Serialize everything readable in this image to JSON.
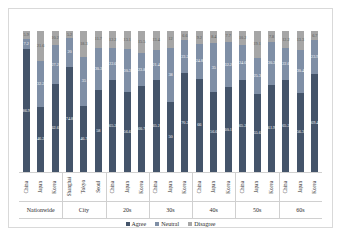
{
  "chart_data": {
    "type": "bar",
    "subtype": "100% stacked column",
    "title": "",
    "xlabel": "",
    "ylabel": "",
    "ylim": [
      0,
      100
    ],
    "grid": false,
    "legend_position": "bottom",
    "series": [
      {
        "name": "Agree",
        "color": "#44546a",
        "values": [
          86.9,
          46.2,
          62.6,
          74.8,
          46.7,
          58.0,
          65.2,
          56.6,
          60.7,
          65.2,
          50.0,
          70.2,
          66.0,
          56.6,
          60.1,
          65.2,
          55.6,
          61.9,
          65.2,
          56.3,
          69.4
        ]
      },
      {
        "name": "Neutral",
        "color": "#7f8fa6",
        "values": [
          7.2,
          32.2,
          27.2,
          20.0,
          35.0,
          30.3,
          22.6,
          30.3,
          23.8,
          21.4,
          38.0,
          23.2,
          24.8,
          35.0,
          32.2,
          24.6,
          25.3,
          30.3,
          22.6,
          30.4,
          23.9
        ]
      },
      {
        "name": "Disagree",
        "color": "#a6a6a6",
        "values": [
          5.9,
          21.6,
          10.2,
          5.2,
          18.3,
          11.7,
          12.2,
          13.1,
          15.5,
          13.4,
          12.0,
          6.6,
          9.2,
          8.4,
          7.7,
          10.2,
          19.1,
          7.8,
          12.2,
          13.3,
          6.7
        ]
      }
    ],
    "categories": [
      "China",
      "Japan",
      "Korea",
      "Shanghai",
      "Tokyo",
      "Seoul",
      "China",
      "Japan",
      "Korea",
      "China",
      "Japan",
      "Korea",
      "China",
      "Japan",
      "Korea",
      "China",
      "Japan",
      "Korea",
      "China",
      "Japan",
      "Korea"
    ],
    "groups": [
      {
        "label": "Nationwide",
        "count": 3
      },
      {
        "label": "City",
        "count": 3
      },
      {
        "label": "20s",
        "count": 3
      },
      {
        "label": "30s",
        "count": 3
      },
      {
        "label": "40s",
        "count": 3
      },
      {
        "label": "50s",
        "count": 3
      },
      {
        "label": "60s",
        "count": 3
      }
    ]
  },
  "legend": {
    "items": [
      {
        "label": "Agree",
        "color": "#44546a"
      },
      {
        "label": "Neutral",
        "color": "#7f8fa6"
      },
      {
        "label": "Disagree",
        "color": "#a6a6a6"
      }
    ]
  },
  "colors": {
    "agree": "#44546a",
    "neutral": "#7f8fa6",
    "disagree": "#a6a6a6",
    "border": "#d9d9d9",
    "background": "#ffffff"
  }
}
